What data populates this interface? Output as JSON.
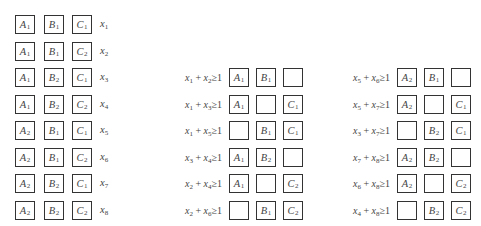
{
  "left_grid": {
    "rows": [
      {
        "cells": [
          {
            "l": "A",
            "s": "1"
          },
          {
            "l": "B",
            "s": "1"
          },
          {
            "l": "C",
            "s": "1"
          }
        ],
        "var": {
          "l": "x",
          "s": "1"
        }
      },
      {
        "cells": [
          {
            "l": "A",
            "s": "1"
          },
          {
            "l": "B",
            "s": "1"
          },
          {
            "l": "C",
            "s": "2"
          }
        ],
        "var": {
          "l": "x",
          "s": "2"
        }
      },
      {
        "cells": [
          {
            "l": "A",
            "s": "1"
          },
          {
            "l": "B",
            "s": "2"
          },
          {
            "l": "C",
            "s": "1"
          }
        ],
        "var": {
          "l": "x",
          "s": "3"
        }
      },
      {
        "cells": [
          {
            "l": "A",
            "s": "1"
          },
          {
            "l": "B",
            "s": "2"
          },
          {
            "l": "C",
            "s": "2"
          }
        ],
        "var": {
          "l": "x",
          "s": "4"
        }
      },
      {
        "cells": [
          {
            "l": "A",
            "s": "2"
          },
          {
            "l": "B",
            "s": "1"
          },
          {
            "l": "C",
            "s": "1"
          }
        ],
        "var": {
          "l": "x",
          "s": "5"
        }
      },
      {
        "cells": [
          {
            "l": "A",
            "s": "2"
          },
          {
            "l": "B",
            "s": "1"
          },
          {
            "l": "C",
            "s": "2"
          }
        ],
        "var": {
          "l": "x",
          "s": "6"
        }
      },
      {
        "cells": [
          {
            "l": "A",
            "s": "2"
          },
          {
            "l": "B",
            "s": "2"
          },
          {
            "l": "C",
            "s": "1"
          }
        ],
        "var": {
          "l": "x",
          "s": "7"
        }
      },
      {
        "cells": [
          {
            "l": "A",
            "s": "2"
          },
          {
            "l": "B",
            "s": "2"
          },
          {
            "l": "C",
            "s": "2"
          }
        ],
        "var": {
          "l": "x",
          "s": "8"
        }
      }
    ]
  },
  "middle_grid": {
    "rows": [
      {
        "constraint": {
          "a": "1",
          "b": "2",
          "rel": "≥",
          "rhs": "1"
        },
        "cells": [
          {
            "l": "A",
            "s": "1"
          },
          {
            "l": "B",
            "s": "1"
          },
          {
            "l": "",
            "s": ""
          }
        ]
      },
      {
        "constraint": {
          "a": "1",
          "b": "3",
          "rel": "≥",
          "rhs": "1"
        },
        "cells": [
          {
            "l": "A",
            "s": "1"
          },
          {
            "l": "",
            "s": ""
          },
          {
            "l": "C",
            "s": "1"
          }
        ]
      },
      {
        "constraint": {
          "a": "1",
          "b": "5",
          "rel": "≥",
          "rhs": "1"
        },
        "cells": [
          {
            "l": "",
            "s": ""
          },
          {
            "l": "B",
            "s": "1"
          },
          {
            "l": "C",
            "s": "1"
          }
        ]
      },
      {
        "constraint": {
          "a": "3",
          "b": "4",
          "rel": "≥",
          "rhs": "1"
        },
        "cells": [
          {
            "l": "A",
            "s": "1"
          },
          {
            "l": "B",
            "s": "2"
          },
          {
            "l": "",
            "s": ""
          }
        ]
      },
      {
        "constraint": {
          "a": "2",
          "b": "4",
          "rel": "≥",
          "rhs": "1"
        },
        "cells": [
          {
            "l": "A",
            "s": "1"
          },
          {
            "l": "",
            "s": ""
          },
          {
            "l": "C",
            "s": "2"
          }
        ]
      },
      {
        "constraint": {
          "a": "2",
          "b": "6",
          "rel": "≥",
          "rhs": "1"
        },
        "cells": [
          {
            "l": "",
            "s": ""
          },
          {
            "l": "B",
            "s": "1"
          },
          {
            "l": "C",
            "s": "2"
          }
        ]
      }
    ]
  },
  "right_grid": {
    "rows": [
      {
        "constraint": {
          "a": "5",
          "b": "6",
          "rel": "≥",
          "rhs": "1"
        },
        "cells": [
          {
            "l": "A",
            "s": "2"
          },
          {
            "l": "B",
            "s": "1"
          },
          {
            "l": "",
            "s": ""
          }
        ]
      },
      {
        "constraint": {
          "a": "5",
          "b": "7",
          "rel": "≥",
          "rhs": "1"
        },
        "cells": [
          {
            "l": "A",
            "s": "2"
          },
          {
            "l": "",
            "s": ""
          },
          {
            "l": "C",
            "s": "1"
          }
        ]
      },
      {
        "constraint": {
          "a": "3",
          "b": "7",
          "rel": "≥",
          "rhs": "1"
        },
        "cells": [
          {
            "l": "",
            "s": ""
          },
          {
            "l": "B",
            "s": "2"
          },
          {
            "l": "C",
            "s": "1"
          }
        ]
      },
      {
        "constraint": {
          "a": "7",
          "b": "8",
          "rel": "≥",
          "rhs": "1"
        },
        "cells": [
          {
            "l": "A",
            "s": "2"
          },
          {
            "l": "B",
            "s": "2"
          },
          {
            "l": "",
            "s": ""
          }
        ]
      },
      {
        "constraint": {
          "a": "6",
          "b": "8",
          "rel": "≥",
          "rhs": "1"
        },
        "cells": [
          {
            "l": "A",
            "s": "2"
          },
          {
            "l": "",
            "s": ""
          },
          {
            "l": "C",
            "s": "2"
          }
        ]
      },
      {
        "constraint": {
          "a": "4",
          "b": "8",
          "rel": "≥",
          "rhs": "1"
        },
        "cells": [
          {
            "l": "",
            "s": ""
          },
          {
            "l": "B",
            "s": "2"
          },
          {
            "l": "C",
            "s": "2"
          }
        ]
      }
    ]
  },
  "layout": {
    "left": {
      "x": [
        15,
        44,
        72
      ],
      "var_x": 100,
      "y0": 15,
      "dy": 26.5
    },
    "middle": {
      "x": [
        229,
        256,
        283
      ],
      "cons_right": 222,
      "y0": 68,
      "dy": 26.5
    },
    "right": {
      "x": [
        397,
        424,
        451
      ],
      "cons_right": 390,
      "y0": 68,
      "dy": 26.5
    }
  }
}
